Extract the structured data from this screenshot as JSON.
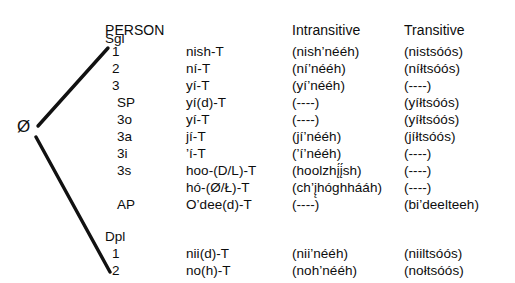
{
  "headers": {
    "person": "PERSON",
    "intransitive": "Intransitive",
    "transitive": "Transitive"
  },
  "tree": {
    "root_label": "Ø",
    "branch_top_target": "1",
    "branch_bottom_target": "2"
  },
  "groups": [
    {
      "label": "Sgl",
      "rows": [
        {
          "person": "1",
          "stem": "nish-T",
          "intransitive": "(nish’nééh)",
          "transitive": "(nistsóós)"
        },
        {
          "person": "2",
          "stem": "ní-T",
          "intransitive": "(ní’nééh)",
          "transitive": "(níłtsóós)"
        },
        {
          "person": "3",
          "stem": "yí-T",
          "intransitive": "(yí’nééh)",
          "transitive": "(----)"
        },
        {
          "person": "SP",
          "stem": "yí(d)-T",
          "intransitive": "(----)",
          "transitive": "(yíłtsóós)"
        },
        {
          "person": "3o",
          "stem": "yí-T",
          "intransitive": "(----)",
          "transitive": "(yíłtsóós)"
        },
        {
          "person": "3a",
          "stem": "jí-T",
          "intransitive": "(jí’nééh)",
          "transitive": "(jíłtsóós)"
        },
        {
          "person": "3i",
          "stem": "’í-T",
          "intransitive": "(’í’nééh)",
          "transitive": "(----)"
        },
        {
          "person": "3s",
          "stem": "hoo-(D/L)-T",
          "intransitive": "(hoolzhį́į́sh)",
          "transitive": "(----)"
        },
        {
          "person": "",
          "stem": "hó-(Ø/Ł)-T",
          "intransitive": "(ch’į̨hóghhááh)",
          "transitive": "(----)"
        }
      ]
    },
    {
      "label": "",
      "rows": [
        {
          "person": "AP",
          "stem": "O’dee(d)-T",
          "intransitive": "(----)",
          "transitive": "(bi’deelteeh)"
        }
      ]
    },
    {
      "label": "Dpl",
      "rows": [
        {
          "person": "1",
          "stem": "nii(d)-T",
          "intransitive": "(nii’nééh)",
          "transitive": "(niiltsóós)"
        },
        {
          "person": "2",
          "stem": "no(h)-T",
          "intransitive": "(noh’nééh)",
          "transitive": "(nołtsóós)"
        }
      ]
    }
  ],
  "layout": {
    "rows": [
      {
        "kind": "header",
        "top": 22
      },
      {
        "kind": "subhdr",
        "top": 30,
        "label": "Sgl"
      },
      {
        "kind": "data",
        "top": 43,
        "group": 0,
        "index": 0,
        "indent": 1
      },
      {
        "kind": "data",
        "top": 60,
        "group": 0,
        "index": 1,
        "indent": 1
      },
      {
        "kind": "data",
        "top": 77,
        "group": 0,
        "index": 2,
        "indent": 1
      },
      {
        "kind": "data",
        "top": 94,
        "group": 0,
        "index": 3,
        "indent": 2
      },
      {
        "kind": "data",
        "top": 111,
        "group": 0,
        "index": 4,
        "indent": 2
      },
      {
        "kind": "data",
        "top": 128,
        "group": 0,
        "index": 5,
        "indent": 2
      },
      {
        "kind": "data",
        "top": 145,
        "group": 0,
        "index": 6,
        "indent": 2
      },
      {
        "kind": "data",
        "top": 162,
        "group": 0,
        "index": 7,
        "indent": 2
      },
      {
        "kind": "data",
        "top": 179,
        "group": 0,
        "index": 8,
        "indent": 2
      },
      {
        "kind": "data",
        "top": 196,
        "group": 1,
        "index": 0,
        "indent": 2
      },
      {
        "kind": "subhdr",
        "top": 228,
        "label": "Dpl"
      },
      {
        "kind": "data",
        "top": 245,
        "group": 2,
        "index": 0,
        "indent": 1
      },
      {
        "kind": "data",
        "top": 262,
        "group": 2,
        "index": 1,
        "indent": 1
      }
    ]
  }
}
